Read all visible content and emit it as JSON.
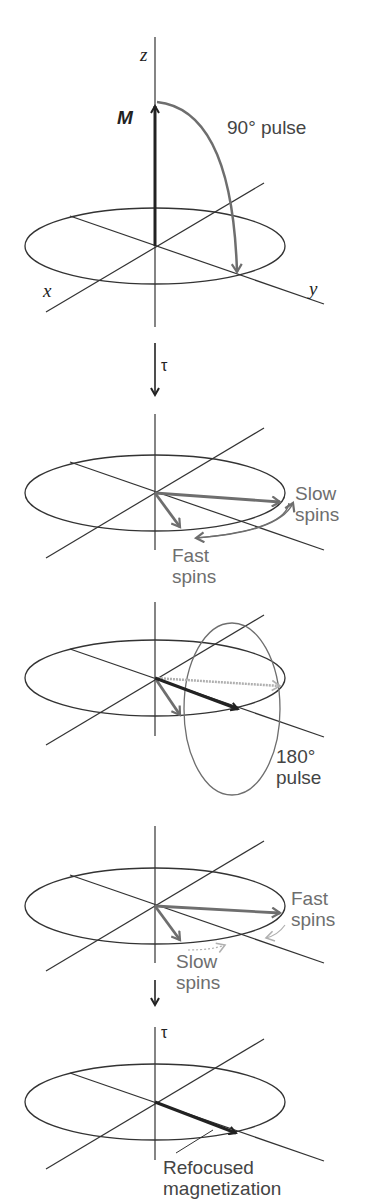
{
  "figure": {
    "panels": [
      {
        "id": "p1",
        "axis_labels": {
          "z": "z",
          "x": "x",
          "y": "y"
        },
        "vector_label": "M",
        "pulse_label": "90°  pulse"
      },
      {
        "id": "p2",
        "delay_label": "τ",
        "slow_label_1": "Slow",
        "slow_label_2": "spins",
        "fast_label_1": "Fast",
        "fast_label_2": "spins"
      },
      {
        "id": "p3",
        "pulse_label_1": "180°",
        "pulse_label_2": "pulse"
      },
      {
        "id": "p4",
        "fast_label_1": "Fast",
        "fast_label_2": "spins",
        "slow_label_1": "Slow",
        "slow_label_2": "spins"
      },
      {
        "id": "p5",
        "delay_label": "τ",
        "result_label_1": "Refocused",
        "result_label_2": "magnetization"
      }
    ]
  },
  "colors": {
    "dark": "#222222",
    "gray": "#6e6e6e",
    "light": "#b0b0b0"
  }
}
